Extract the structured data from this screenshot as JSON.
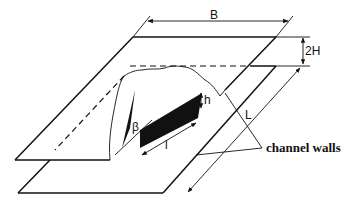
{
  "diagram": {
    "labels": {
      "width": "B",
      "gap": "2H",
      "rib_height": "h",
      "rib_length": "l",
      "angle": "β",
      "channel_length": "L",
      "walls": "channel walls"
    },
    "colors": {
      "line": "#111111",
      "fill": "#111111",
      "background": "#ffffff"
    }
  }
}
